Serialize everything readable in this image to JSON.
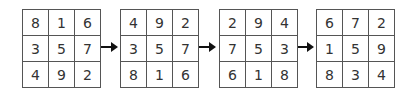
{
  "diagram": {
    "squares": [
      {
        "rows": [
          [
            "8",
            "1",
            "6"
          ],
          [
            "3",
            "5",
            "7"
          ],
          [
            "4",
            "9",
            "2"
          ]
        ]
      },
      {
        "rows": [
          [
            "4",
            "9",
            "2"
          ],
          [
            "3",
            "5",
            "7"
          ],
          [
            "8",
            "1",
            "6"
          ]
        ]
      },
      {
        "rows": [
          [
            "2",
            "9",
            "4"
          ],
          [
            "7",
            "5",
            "3"
          ],
          [
            "6",
            "1",
            "8"
          ]
        ]
      },
      {
        "rows": [
          [
            "6",
            "7",
            "2"
          ],
          [
            "1",
            "5",
            "9"
          ],
          [
            "8",
            "3",
            "4"
          ]
        ]
      }
    ],
    "arrows": [
      "right-arrow-icon",
      "right-arrow-icon",
      "right-arrow-icon"
    ],
    "colors": {
      "grid_line": "#555555",
      "text": "#333333",
      "arrow": "#111111"
    }
  }
}
